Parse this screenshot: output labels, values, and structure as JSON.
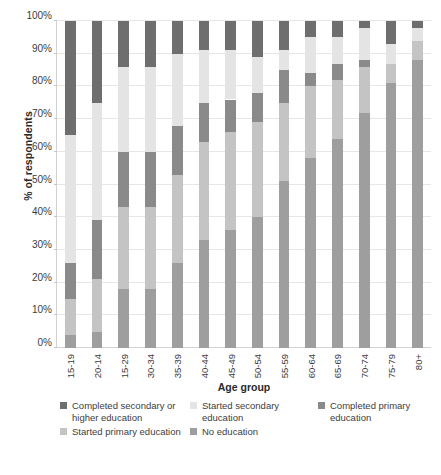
{
  "chart_data": {
    "type": "bar",
    "subtype": "stacked-percentage-column",
    "title": "",
    "xlabel": "Age group",
    "ylabel": "% of respondents",
    "ylim": [
      0,
      100
    ],
    "yticks": [
      0,
      10,
      20,
      30,
      40,
      50,
      60,
      70,
      80,
      90,
      100
    ],
    "ytick_labels": [
      "0%",
      "10%",
      "20%",
      "30%",
      "40%",
      "50%",
      "60%",
      "70%",
      "80%",
      "90%",
      "100%"
    ],
    "grid": true,
    "legend_position": "bottom",
    "stack_order_bottom_to_top": [
      "No education",
      "Started primary education",
      "Completed primary education",
      "Started secondary education",
      "Completed secondary or higher education"
    ],
    "categories": [
      "15-19",
      "20-14",
      "15-29",
      "30-34",
      "35-39",
      "40-44",
      "45-49",
      "50-54",
      "55-59",
      "60-64",
      "65-69",
      "70-74",
      "75-79",
      "80+"
    ],
    "series": [
      {
        "name": "No education",
        "color": "#9e9e9e",
        "values": [
          4,
          5,
          18,
          18,
          26,
          33,
          36,
          40,
          51,
          58,
          64,
          72,
          81,
          88
        ]
      },
      {
        "name": "Started primary education",
        "color": "#c4c4c4",
        "values": [
          11,
          16,
          25,
          25,
          27,
          30,
          30,
          29,
          24,
          22,
          18,
          14,
          6,
          6
        ]
      },
      {
        "name": "Completed primary education",
        "color": "#8a8a8a",
        "values": [
          11,
          18,
          17,
          17,
          15,
          12,
          10,
          9,
          10,
          4,
          5,
          2,
          0,
          0
        ]
      },
      {
        "name": "Started secondary education",
        "color": "#e4e4e4",
        "values": [
          39,
          36,
          26,
          26,
          22,
          16,
          15,
          11,
          6,
          11,
          8,
          10,
          6,
          4
        ]
      },
      {
        "name": "Completed secondary or higher education",
        "color": "#6e6e6e",
        "values": [
          35,
          25,
          14,
          14,
          10,
          9,
          9,
          11,
          9,
          5,
          5,
          2,
          7,
          2
        ]
      }
    ]
  },
  "legend": {
    "items": [
      {
        "label": "Completed secondary or higher education",
        "color": "#6e6e6e"
      },
      {
        "label": "Started secondary education",
        "color": "#e4e4e4"
      },
      {
        "label": "Completed primary education",
        "color": "#8a8a8a"
      },
      {
        "label": "Started primary education",
        "color": "#c4c4c4"
      },
      {
        "label": "No education",
        "color": "#9e9e9e"
      }
    ]
  },
  "colors": {
    "background": "#ffffff",
    "gridline": "#e6e6e6",
    "axis": "#d2d2d2",
    "text": "#3d3d3d"
  }
}
